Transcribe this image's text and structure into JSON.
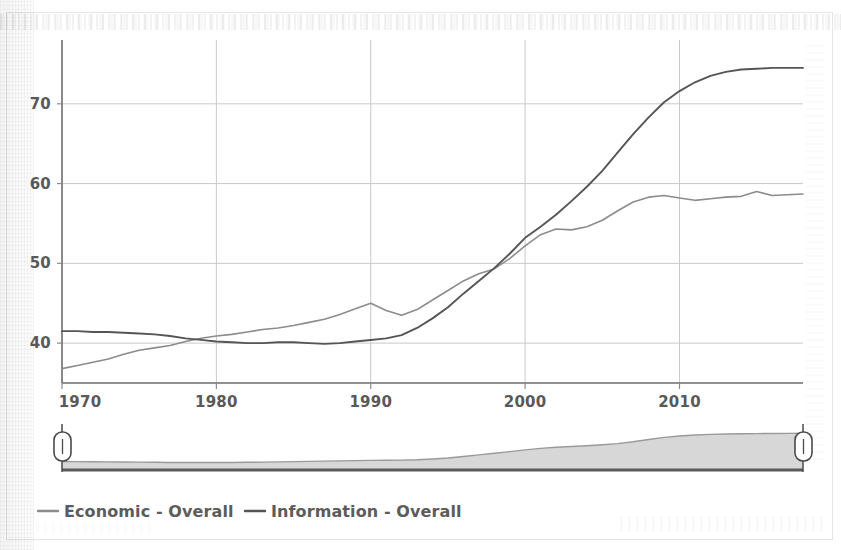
{
  "chart_data": {
    "type": "line",
    "title": "",
    "subtitle": "",
    "xlabel": "",
    "ylabel": "",
    "xlim": [
      1970,
      2018
    ],
    "ylim": [
      35,
      78
    ],
    "xticks": [
      1970,
      1980,
      1990,
      2000,
      2010
    ],
    "xtick_labels": [
      "1970",
      "1980",
      "1990",
      "2000",
      "2010"
    ],
    "yticks": [
      40,
      50,
      60,
      70
    ],
    "ytick_labels": [
      "40",
      "50",
      "60",
      "70"
    ],
    "grid": "horizontal-and-vertical",
    "legend_position": "bottom-left",
    "x": [
      1970,
      1971,
      1972,
      1973,
      1974,
      1975,
      1976,
      1977,
      1978,
      1979,
      1980,
      1981,
      1982,
      1983,
      1984,
      1985,
      1986,
      1987,
      1988,
      1989,
      1990,
      1991,
      1992,
      1993,
      1994,
      1995,
      1996,
      1997,
      1998,
      1999,
      2000,
      2001,
      2002,
      2003,
      2004,
      2005,
      2006,
      2007,
      2008,
      2009,
      2010,
      2011,
      2012,
      2013,
      2014,
      2015,
      2016,
      2017,
      2018
    ],
    "series": [
      {
        "name": "Economic - Overall",
        "color": "#8c8c8c",
        "stroke_width": 1.6,
        "values": [
          36.8,
          37.2,
          37.6,
          38.0,
          38.6,
          39.1,
          39.4,
          39.7,
          40.2,
          40.6,
          40.9,
          41.1,
          41.4,
          41.7,
          41.9,
          42.2,
          42.6,
          43.0,
          43.6,
          44.3,
          45.0,
          44.1,
          43.5,
          44.2,
          45.4,
          46.6,
          47.8,
          48.7,
          49.3,
          50.6,
          52.2,
          53.6,
          54.3,
          54.2,
          54.6,
          55.4,
          56.6,
          57.7,
          58.3,
          58.5,
          58.2,
          57.9,
          58.1,
          58.3,
          58.4,
          59.0,
          58.5,
          58.6,
          58.7
        ]
      },
      {
        "name": "Information - Overall",
        "color": "#555555",
        "stroke_width": 1.9,
        "values": [
          41.5,
          41.5,
          41.4,
          41.4,
          41.3,
          41.2,
          41.1,
          40.9,
          40.6,
          40.4,
          40.2,
          40.1,
          40.0,
          40.0,
          40.1,
          40.1,
          40.0,
          39.9,
          40.0,
          40.2,
          40.4,
          40.6,
          41.0,
          41.9,
          43.1,
          44.5,
          46.2,
          47.8,
          49.4,
          51.2,
          53.2,
          54.6,
          56.1,
          57.8,
          59.6,
          61.6,
          63.9,
          66.2,
          68.3,
          70.2,
          71.6,
          72.7,
          73.5,
          74.0,
          74.3,
          74.4,
          74.5,
          74.5,
          74.5
        ]
      }
    ],
    "navigator": {
      "type": "area",
      "fill_color": "#d7d7d7",
      "line_color": "#9a9a9a",
      "baseline_color": "#5a5a5a",
      "values": [
        6.5,
        6.4,
        6.3,
        6.2,
        6.1,
        6.0,
        5.9,
        5.8,
        5.8,
        5.7,
        5.7,
        5.8,
        5.9,
        6.0,
        6.2,
        6.4,
        6.6,
        6.8,
        7.0,
        7.2,
        7.4,
        7.5,
        7.6,
        7.8,
        8.4,
        9.2,
        10.4,
        11.6,
        12.8,
        14.1,
        15.4,
        16.6,
        17.4,
        18.0,
        18.6,
        19.3,
        20.2,
        21.6,
        23.4,
        25.0,
        26.1,
        26.8,
        27.3,
        27.6,
        27.8,
        27.9,
        28.0,
        28.1,
        28.2
      ],
      "handle_left_position": 0,
      "handle_right_position": 100
    }
  },
  "legend": {
    "items": [
      {
        "label": "Economic - Overall",
        "marker": "line-dash",
        "color": "#8c8c8c"
      },
      {
        "label": "Information - Overall",
        "marker": "line-dash",
        "color": "#555555"
      }
    ]
  },
  "colors": {
    "economic": "#8c8c8c",
    "information": "#555555",
    "grid": "#c9c9c9",
    "axis": "#6d6d6d",
    "text": "#595959",
    "navigator_fill": "#d7d7d7",
    "background": "#ffffff"
  }
}
